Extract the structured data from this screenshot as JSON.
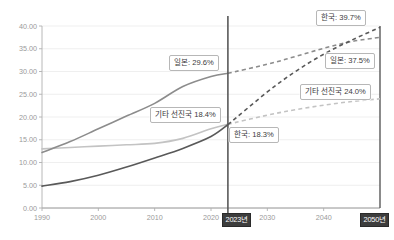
{
  "figure": {
    "top_caption": "",
    "background": "#ffffff"
  },
  "axis": {
    "y_ticks": [
      "40.00",
      "35.00",
      "30.00",
      "25.00",
      "20.00",
      "15.00",
      "10.00",
      "5.00",
      "0.00"
    ],
    "x_ticks": [
      "1990",
      "2000",
      "2010",
      "2020",
      "2030",
      "2040"
    ],
    "x_highlight": [
      "2023년",
      "2050년"
    ]
  },
  "callouts": {
    "japan_now": "일본: 29.6%",
    "japan_future": "일본: 37.5%",
    "korea_now": "한국: 18.3%",
    "korea_future": "한국: 39.7%",
    "other_now": "기타 선진국 18.4%",
    "other_future": "기타 선진국 24.0%"
  },
  "colors": {
    "korea": "#595959",
    "japan": "#8c8c8c",
    "other": "#c3c3c3",
    "divider": "#595959",
    "grid": "#ebebeb",
    "axis": "#b0b0b0",
    "chip_bg": "#3d3d3d"
  },
  "chart_data": {
    "type": "line",
    "title": "",
    "xlabel": "",
    "ylabel": "",
    "xlim": [
      1990,
      2050
    ],
    "ylim": [
      0,
      40
    ],
    "y_tick_values": [
      0,
      5,
      10,
      15,
      20,
      25,
      30,
      35,
      40
    ],
    "x_tick_values": [
      1990,
      2000,
      2010,
      2020,
      2030,
      2040
    ],
    "grid": true,
    "legend": "none",
    "divider_year": 2023,
    "divider_label": "2023년",
    "end_label": "2050년",
    "note": "Solid segments are historical (1990-2023); dashed segments are projections (2023-2050).",
    "series": [
      {
        "name": "한국",
        "color": "#595959",
        "history_x": [
          1990,
          1995,
          2000,
          2005,
          2010,
          2015,
          2020,
          2023
        ],
        "history_y": [
          4.8,
          5.8,
          7.2,
          9.0,
          11.0,
          13.1,
          15.7,
          18.3
        ],
        "projection_x": [
          2023,
          2030,
          2035,
          2040,
          2045,
          2050
        ],
        "projection_y": [
          18.3,
          25.5,
          30.0,
          33.8,
          36.9,
          39.7
        ],
        "value_2023": 18.3,
        "value_2050": 39.7
      },
      {
        "name": "일본",
        "color": "#8c8c8c",
        "history_x": [
          1990,
          1995,
          2000,
          2005,
          2010,
          2015,
          2020,
          2023
        ],
        "history_y": [
          12.2,
          14.6,
          17.4,
          20.2,
          23.0,
          26.7,
          28.9,
          29.6
        ],
        "projection_x": [
          2023,
          2030,
          2035,
          2040,
          2045,
          2050
        ],
        "projection_y": [
          29.6,
          31.6,
          33.3,
          35.1,
          36.6,
          37.5
        ],
        "value_2023": 29.6,
        "value_2050": 37.5
      },
      {
        "name": "기타 선진국",
        "color": "#c3c3c3",
        "history_x": [
          1990,
          1995,
          2000,
          2005,
          2010,
          2015,
          2020,
          2023
        ],
        "history_y": [
          13.0,
          13.3,
          13.6,
          13.9,
          14.2,
          15.3,
          17.4,
          18.4
        ],
        "projection_x": [
          2023,
          2030,
          2035,
          2040,
          2045,
          2050
        ],
        "projection_y": [
          18.4,
          20.4,
          21.6,
          22.6,
          23.4,
          24.0
        ],
        "value_2023": 18.4,
        "value_2050": 24.0
      }
    ]
  }
}
